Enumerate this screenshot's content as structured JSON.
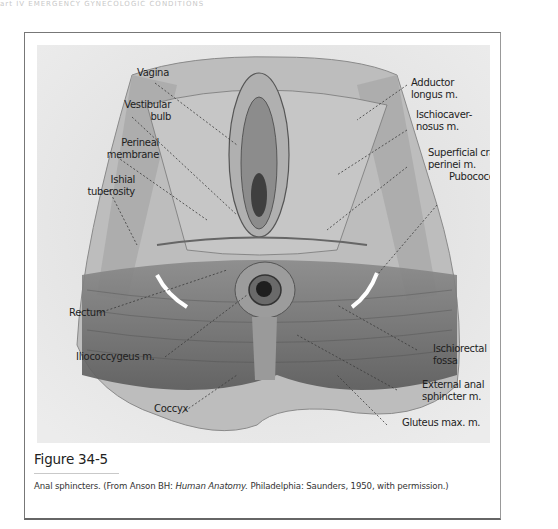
{
  "running_header": "art IV   EMERGENCY GYNECOLOGIC CONDITIONS",
  "figure": {
    "labels": {
      "vagina": "Vagina",
      "vestibular_bulb_1": "Vestibular",
      "vestibular_bulb_2": "bulb",
      "perineal_membrane_1": "Perineal",
      "perineal_membrane_2": "membrane",
      "ishial_tuberosity_1": "Ishial",
      "ishial_tuberosity_2": "tuberosity",
      "rectum": "Rectum",
      "iliococcygeus": "Iliococcygeus m.",
      "coccyx": "Coccyx",
      "adductor_longus_1": "Adductor",
      "adductor_longus_2": "longus m.",
      "ischiocavernosus_1": "Ischiocaver-",
      "ischiocavernosus_2": "nosus m.",
      "superficial_transverse_1": "Superficial cransverse",
      "superficial_transverse_2": "perinei m.",
      "pubococcygeus": "Pubococcygeus m.",
      "ischiorectal_fossa_1": "Ischiorectal",
      "ischiorectal_fossa_2": "fossa",
      "external_anal_sphincter_1": "External anal",
      "external_anal_sphincter_2": "sphincter m.",
      "gluteus_max": "Gluteus max. m."
    },
    "title": "Figure 34-5",
    "caption": {
      "prefix": "Anal sphincters. (From Anson BH: ",
      "book": "Human Anatomy.",
      "suffix": " Philadelphia: Saunders, 1950, with permission.)"
    }
  }
}
